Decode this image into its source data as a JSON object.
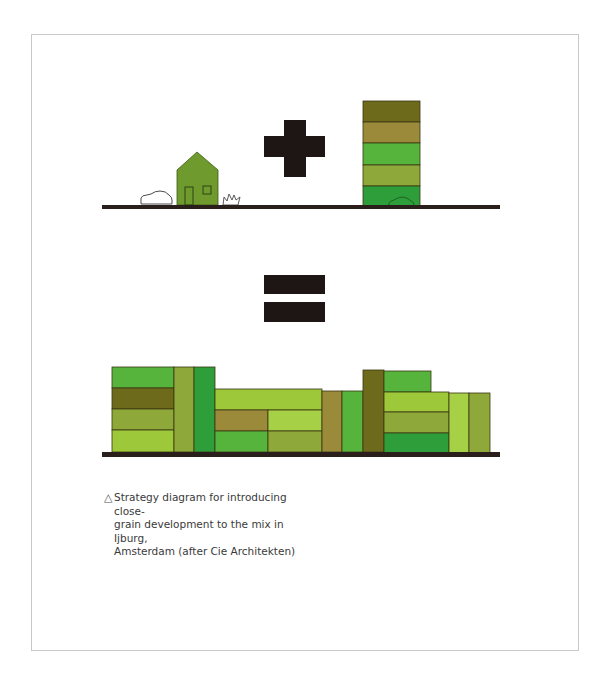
{
  "caption": {
    "marker": "△",
    "lines": [
      "Strategy diagram for introducing close-",
      "grain development to the mix in Ijburg,",
      "Amsterdam (after Cie Architekten)"
    ]
  },
  "colors": {
    "ground": "#2a1f1a",
    "operator": "#1e1614",
    "frame": "#c8c8c8",
    "olive_dark": "#6e6a1c",
    "ochre": "#9a8a3a",
    "green_bright": "#56b43c",
    "green_olive": "#8ea83a",
    "green_mid": "#2e9e3a",
    "lime": "#9cc83a",
    "house": "#6f9a2e"
  },
  "top_scene": {
    "elements": [
      "car-outline",
      "house",
      "grass-tuft",
      "plus-sign",
      "tower-with-car"
    ],
    "tower_bands": [
      "olive_dark",
      "ochre",
      "green_bright",
      "green_olive",
      "green_mid"
    ]
  },
  "equals_sign": "=",
  "bottom_scene": {
    "description": "close-grain mix of varied blocks"
  }
}
